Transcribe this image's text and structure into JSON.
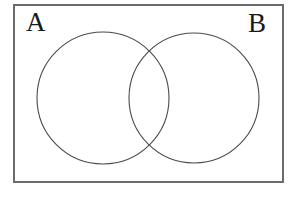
{
  "figure": {
    "kind": "venn-diagram",
    "canvas": {
      "width": 295,
      "height": 202,
      "background_color": "#ffffff"
    },
    "frame": {
      "name": "universal-set-rectangle",
      "x": 13,
      "y": 4,
      "width": 271,
      "height": 179,
      "stroke_color": "#6b6b6b",
      "stroke_width": 2,
      "fill_color": "#ffffff"
    },
    "labels": [
      {
        "id": "A",
        "text": "A",
        "x": 26,
        "y": 9,
        "color": "#1a1a1a",
        "font_size": 27
      },
      {
        "id": "B",
        "text": "B",
        "x": 248,
        "y": 10,
        "color": "#1a1a1a",
        "font_size": 27
      }
    ],
    "circles": [
      {
        "id": "A",
        "name": "set-a-circle",
        "cx": 103,
        "cy": 98,
        "r": 66,
        "stroke_color": "#4a4a4a",
        "stroke_width": 1.1,
        "fill_color": "none"
      },
      {
        "id": "B",
        "name": "set-b-circle",
        "cx": 194,
        "cy": 98,
        "r": 65,
        "stroke_color": "#4a4a4a",
        "stroke_width": 1.1,
        "fill_color": "none"
      }
    ],
    "intersection_points": [
      {
        "x": 150,
        "y": 48
      },
      {
        "x": 150,
        "y": 148
      }
    ]
  }
}
